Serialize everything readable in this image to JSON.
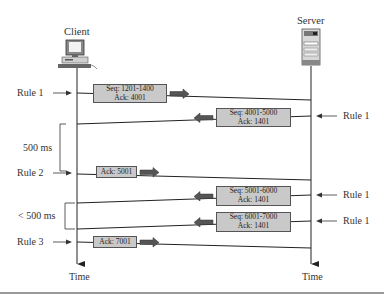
{
  "diagram": {
    "client": {
      "label": "Client",
      "icon": "desktop-computer-icon",
      "time_label": "Time"
    },
    "server": {
      "label": "Server",
      "icon": "server-tower-icon",
      "time_label": "Time"
    },
    "segments": [
      {
        "direction": "client-to-server",
        "lines": [
          "Seq: 1201-1400",
          "Ack: 4001"
        ],
        "rule": "Rule 1",
        "rule_side": "client"
      },
      {
        "direction": "server-to-client",
        "lines": [
          "Seq: 4001-5000",
          "Ack: 1401"
        ],
        "rule": "Rule 1",
        "rule_side": "server"
      },
      {
        "direction": "client-to-server",
        "lines": [
          "Ack: 5001"
        ],
        "rule": "Rule 2",
        "rule_side": "client"
      },
      {
        "direction": "server-to-client",
        "lines": [
          "Seq: 5001-6000",
          "Ack: 1401"
        ],
        "rule": "Rule 1",
        "rule_side": "server"
      },
      {
        "direction": "server-to-client",
        "lines": [
          "Seq: 6001-7000",
          "Ack: 1401"
        ],
        "rule": "Rule 1",
        "rule_side": "server"
      },
      {
        "direction": "client-to-server",
        "lines": [
          "Ack: 7001"
        ],
        "rule": "Rule 3",
        "rule_side": "client"
      }
    ],
    "intervals": [
      {
        "label": "500 ms"
      },
      {
        "label": "< 500 ms"
      }
    ],
    "colors": {
      "box_fill": "#c9c9c9",
      "box_border": "#555555",
      "line": "#222222",
      "arrow_fill": "#555555",
      "text": "#333333"
    }
  }
}
